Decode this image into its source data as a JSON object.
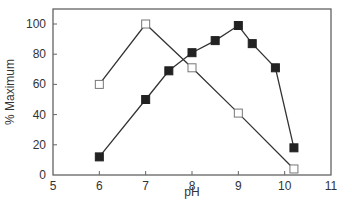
{
  "chart_data": {
    "type": "line",
    "title": "",
    "xlabel": "pH",
    "ylabel": "% Maximum",
    "xlim": [
      5,
      11
    ],
    "ylim": [
      0,
      110
    ],
    "xticks": [
      5,
      6,
      7,
      8,
      9,
      10,
      11
    ],
    "yticks": [
      0,
      20,
      40,
      60,
      80,
      100
    ],
    "grid": false,
    "legend": null,
    "series": [
      {
        "name": "open squares",
        "marker": "open-square",
        "x": [
          6,
          7,
          8,
          9,
          10.2
        ],
        "y": [
          60,
          100,
          71,
          41,
          4
        ]
      },
      {
        "name": "filled squares",
        "marker": "filled-square",
        "x": [
          6,
          7,
          7.5,
          8,
          8.5,
          9,
          9.3,
          9.8,
          10.2
        ],
        "y": [
          12,
          50,
          69,
          81,
          89,
          99,
          87,
          71,
          18
        ]
      }
    ]
  }
}
